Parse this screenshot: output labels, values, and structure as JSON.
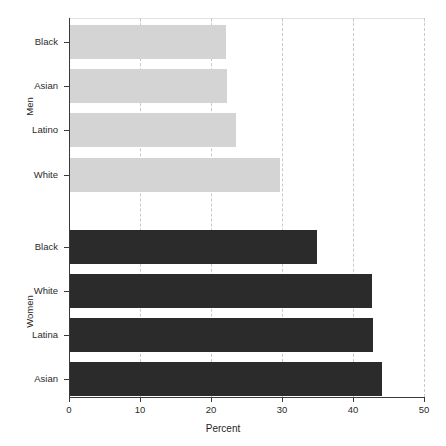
{
  "chart_data": {
    "type": "bar",
    "orientation": "horizontal",
    "title": "",
    "xlabel": "Percent",
    "ylabel": "",
    "xlim": [
      0,
      50
    ],
    "ylim": null,
    "grid": "vertical-dashed",
    "legend": null,
    "xticks": [
      0,
      10,
      20,
      30,
      40,
      50
    ],
    "xticklabels": [
      "0",
      "10",
      "20",
      "30",
      "40",
      "50"
    ],
    "groups": [
      {
        "name": "Men",
        "color": "#d4d4d4",
        "categories": [
          "Black",
          "Asian",
          "Latino",
          "White"
        ],
        "values": [
          22.1,
          22.3,
          23.5,
          29.7
        ]
      },
      {
        "name": "Women",
        "color": "#2b2b2b",
        "categories": [
          "Black",
          "White",
          "Latina",
          "Asian"
        ],
        "values": [
          34.9,
          42.7,
          42.8,
          44.1
        ]
      }
    ],
    "colors": {
      "men_bar": "#d4d4d4",
      "women_bar": "#2b2b2b",
      "gridline": "#c9c9c9",
      "axis": "#3a3a3a",
      "background": "#ffffff"
    }
  }
}
